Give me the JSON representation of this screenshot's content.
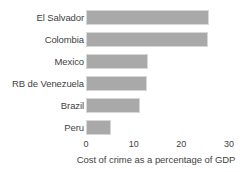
{
  "chart_data": {
    "type": "bar",
    "orientation": "horizontal",
    "title": "",
    "subtitle": "",
    "xlabel": "Cost of crime as a percentage of GDP",
    "ylabel": "",
    "categories": [
      "El Salvador",
      "Colombia",
      "Mexico",
      "RB de Venezuela",
      "Brazil",
      "Peru"
    ],
    "values": [
      25.8,
      25.6,
      13.0,
      12.8,
      11.3,
      5.3
    ],
    "xlim": [
      0,
      30
    ],
    "xticks": [
      0,
      10,
      20,
      30
    ],
    "xtick_labels": [
      "0",
      "10",
      "20",
      "30"
    ],
    "grid": false,
    "legend": false,
    "legend_position": "none",
    "bar_color": "#a9a9a9",
    "bar_border_color": "#d7d7d7",
    "text_color": "#3f3f3f",
    "background_color": "#ffffff",
    "series": [
      {
        "name": "Cost of crime as a percentage of GDP",
        "values": [
          25.8,
          25.6,
          13.0,
          12.8,
          11.3,
          5.3
        ]
      }
    ]
  },
  "axis": {
    "x_title": "Cost of crime as a percentage of GDP",
    "ticks": [
      {
        "label": "0"
      },
      {
        "label": "10"
      },
      {
        "label": "20"
      },
      {
        "label": "30"
      }
    ]
  },
  "rows": [
    {
      "label": "El Salvador",
      "value": 25.8
    },
    {
      "label": "Colombia",
      "value": 25.6
    },
    {
      "label": "Mexico",
      "value": 13.0
    },
    {
      "label": "RB de Venezuela",
      "value": 12.8
    },
    {
      "label": "Brazil",
      "value": 11.3
    },
    {
      "label": "Peru",
      "value": 5.3
    }
  ]
}
